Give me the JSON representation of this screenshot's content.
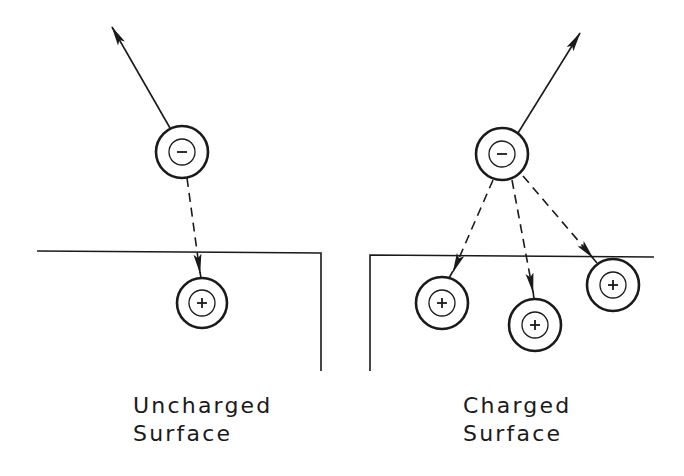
{
  "diagram": {
    "ink_color": "#1a1a1a",
    "background": "#ffffff",
    "panels": [
      {
        "id": "uncharged",
        "label_line1": "Uncharged",
        "label_line2": "Surface",
        "negative_ion": {
          "cx": 182,
          "cy": 152,
          "symbol": "−"
        },
        "escape_arrow": {
          "from": [
            170,
            128
          ],
          "to": [
            112,
            27
          ]
        },
        "positive_ions": [
          {
            "cx": 202,
            "cy": 303,
            "symbol": "+"
          }
        ],
        "attraction_arrows": [
          {
            "from": [
              187,
              178
            ],
            "tip": [
              200,
              273
            ],
            "stub_end": [
              201,
              278
            ]
          }
        ],
        "surface": {
          "top_y_left": 251,
          "top_y_right": 253,
          "x_left": 37,
          "x_corner": 321,
          "bottom_y": 371
        }
      },
      {
        "id": "charged",
        "label_line1": "Charged",
        "label_line2": "Surface",
        "negative_ion": {
          "cx": 502,
          "cy": 154,
          "symbol": "−"
        },
        "escape_arrow": {
          "from": [
            518,
            133
          ],
          "to": [
            580,
            33
          ]
        },
        "positive_ions": [
          {
            "cx": 442,
            "cy": 303,
            "symbol": "+"
          },
          {
            "cx": 535,
            "cy": 325,
            "symbol": "+"
          },
          {
            "cx": 613,
            "cy": 285,
            "symbol": "+"
          }
        ],
        "attraction_arrows": [
          {
            "from": [
              493,
              180
            ],
            "tip": [
              453,
              272
            ],
            "stub_end": [
              449,
              278
            ]
          },
          {
            "from": [
              512,
              180
            ],
            "tip": [
              533,
              292
            ],
            "stub_end": [
              534,
              299
            ]
          },
          {
            "from": [
              523,
              176
            ],
            "tip": [
              593,
              258
            ],
            "stub_end": [
              597,
              263
            ]
          }
        ],
        "surface": {
          "top_y_left": 255,
          "top_y_right": 257,
          "x_corner": 370,
          "x_right": 654,
          "bottom_y": 371
        }
      }
    ],
    "ion_outer_radius": 26,
    "ion_inner_radius": 13
  }
}
